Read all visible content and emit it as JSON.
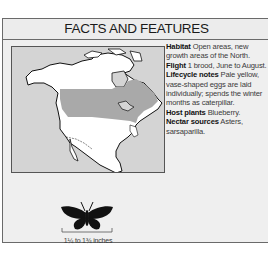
{
  "header": {
    "title": "FACTS AND FEATURES"
  },
  "map": {
    "region": "North America",
    "range_color": "#a9a9a9",
    "land_color": "#ffffff",
    "water_color": "#d4d4d4"
  },
  "facts": [
    {
      "label": "Habitat",
      "text": "Open areas, new growth areas of the North."
    },
    {
      "label": "Flight",
      "text": "1 brood, June to August."
    },
    {
      "label": "Lifecycle notes",
      "text": "Pale yellow, vase-shaped eggs are laid individually; spends the winter months as caterpillar."
    },
    {
      "label": "Host plants",
      "text": "Blueberry."
    },
    {
      "label": "Nectar sources",
      "text": "Asters, sarsaparilla."
    }
  ],
  "specimen": {
    "icon": "butterfly-silhouette-icon",
    "size_label": "1¼ to 1¾ inches"
  }
}
